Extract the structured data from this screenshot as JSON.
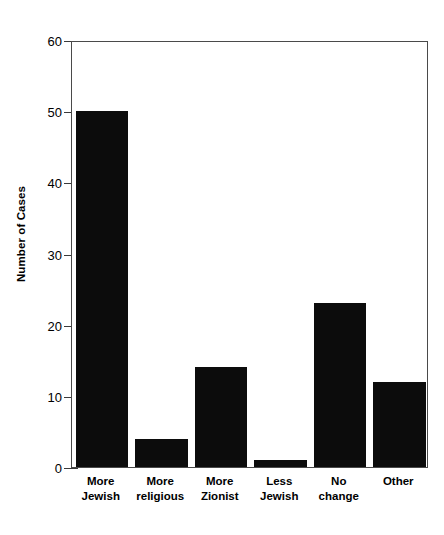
{
  "chart_data": {
    "type": "bar",
    "title": "",
    "subtitle": "",
    "xlabel": "",
    "ylabel": "Number of Cases",
    "categories": [
      "More\nJewish",
      "More\nreligious",
      "More\nZionist",
      "Less\nJewish",
      "No\nchange",
      "Other"
    ],
    "values": [
      50,
      4,
      14,
      1,
      23,
      12
    ],
    "ylim": [
      0,
      60
    ],
    "yticks": [
      0,
      10,
      20,
      30,
      40,
      50,
      60
    ],
    "ytick_labels": [
      "0",
      "10",
      "20",
      "30",
      "40",
      "50",
      "60"
    ],
    "grid": false,
    "legend": false,
    "legend_position": "none",
    "bar_color": "#0c0c0c",
    "background_color": "#ffffff",
    "frame_color": "#4a4a4a"
  }
}
